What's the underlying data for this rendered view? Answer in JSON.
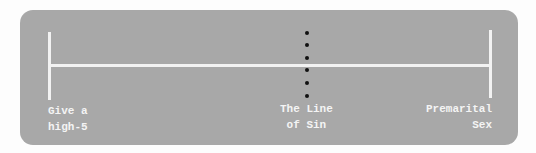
{
  "diagram": {
    "type": "spectrum-line",
    "labels": {
      "left": "Give a\nhigh-5",
      "middle": "The Line\nof Sin",
      "right": "Premarital\nSex"
    },
    "colors": {
      "panel": "#a8a8a8",
      "line": "#f2f2f2",
      "dots": "#111111",
      "text": "#f4f4f4"
    }
  }
}
